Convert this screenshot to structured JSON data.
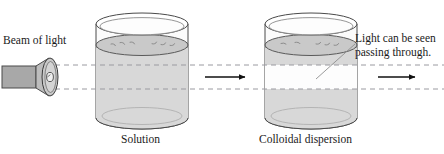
{
  "figure": {
    "width": 444,
    "height": 154,
    "background_color": "#ffffff"
  },
  "labels": {
    "beam_of_light": "Beam of light",
    "light_seen_line1": "Light can be seen",
    "light_seen_line2": "passing through.",
    "caption_left": "Solution",
    "caption_right": "Colloidal dispersion"
  },
  "colors": {
    "outline": "#3c3c3c",
    "glass_fill": "#fbfbfb",
    "liquid_fill": "#d6d6d6",
    "liquid_surface_fill": "#c4c4c4",
    "beam_visible_fill": "#fdfdfd",
    "lamp_barrel_fill": "#a8a8a8",
    "lamp_reflector_fill": "#c9c9c9",
    "bulb_fill": "#e8e8e8",
    "dashed_line": "#9a9aa0",
    "arrow": "#111111",
    "leader_line": "#8e8e8e",
    "text": "#1a1a1a"
  },
  "elements": {
    "lamp": {
      "name": "flashlight",
      "barrel_label": "lamp-barrel",
      "reflector_label": "lamp-reflector",
      "bulb_label": "lamp-bulb"
    },
    "beaker_left": {
      "name": "beaker-solution",
      "contents": "Solution",
      "beam_visible": false
    },
    "beaker_right": {
      "name": "beaker-colloidal-dispersion",
      "contents": "Colloidal dispersion",
      "beam_visible": true
    },
    "arrows": [
      {
        "name": "arrow-between-beakers"
      },
      {
        "name": "arrow-exiting-right"
      }
    ],
    "beam_rays": {
      "name": "light-beam-dashed-rays",
      "count": 2,
      "style": "dashed"
    }
  }
}
